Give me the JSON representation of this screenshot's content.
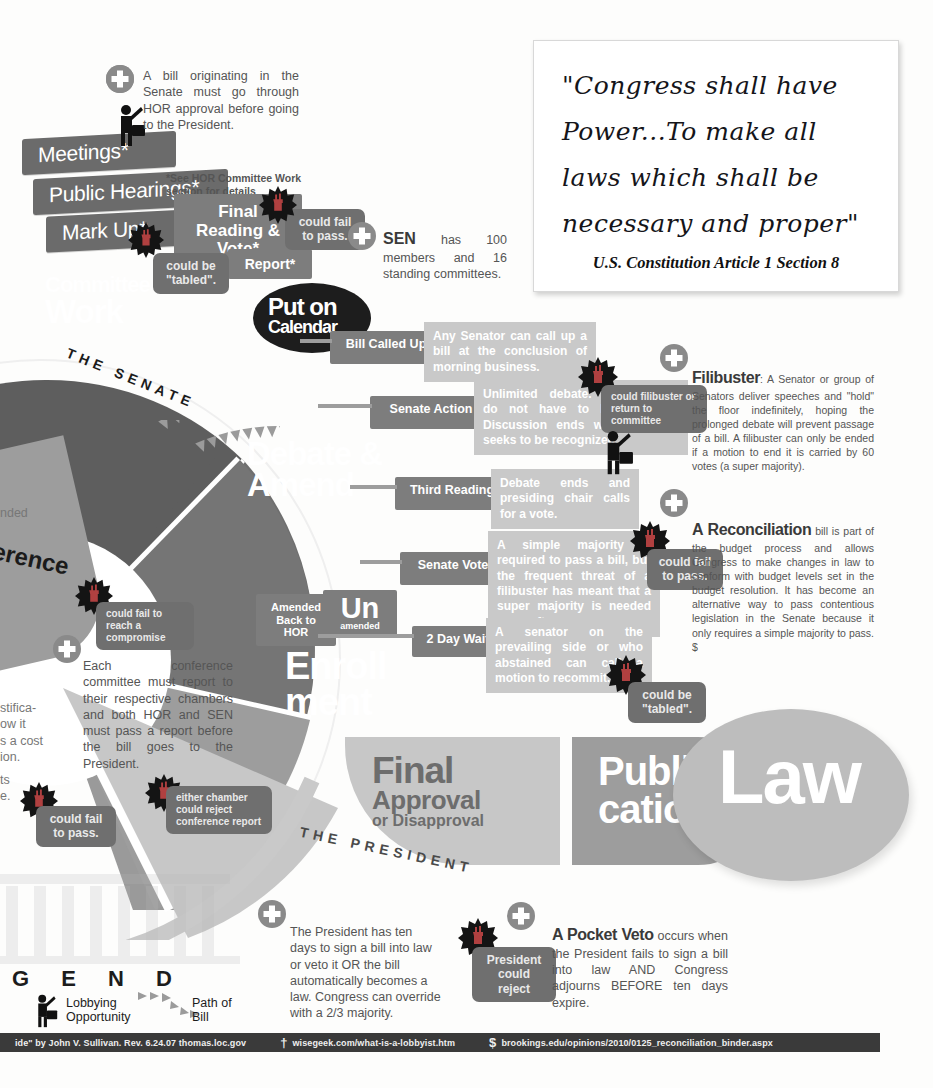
{
  "quote": {
    "lines": [
      "\"Congress shall have",
      "Power...To make all",
      "laws which shall be",
      "necessary and proper\""
    ],
    "source": "U.S. Constitution Article 1 Section 8"
  },
  "notes": {
    "senate_origin": "A bill originating in the Senate must go through HOR approval before going to the President.",
    "hor_footnote": "*See HOR Committee Work section for details",
    "sen_title": "SEN",
    "sen_body": "has 100 members and 16 standing committees.",
    "filibuster_title": "Filibuster",
    "filibuster_body": ": A Senator or group of Senators deliver speeches and \"hold\" the floor indefinitely, hoping the prolonged debate will prevent passage of a bill. A filibuster can only be ended if a motion to end it is carried by 60 votes (a super majority).",
    "reconciliation_title": "A Reconciliation",
    "reconciliation_body": "bill is part of the budget process and allows Congress to make changes in law to conform with budget levels set in the budget resolution. It has become an alternative way to pass contentious legislation in the Senate because it only requires a simple majority to pass. $",
    "conference_body": "Each conference committee must report to their respective chambers and both HOR and SEN must pass a report before the bill goes to the President.",
    "president_body": "The President has ten days to sign a bill into law or veto it OR the bill automatically becomes a law.  Congress can override with a 2/3 majority.",
    "pocketveto_title": "A Pocket Veto",
    "pocketveto_body": "occurs when the President fails to sign a bill into law AND Congress adjourns BEFORE ten days expire."
  },
  "steps": {
    "meetings": "Meetings*",
    "public_hearings": "Public Hearings*",
    "mark_up": "Mark Up*",
    "final_reading": "Final Reading & Vote*",
    "report": "Report*"
  },
  "warnings": {
    "could_be_tabled_1": "could be \"tabled\".",
    "could_fail_to_pass_1": "could fail to pass.",
    "could_filibuster": "could filibuster or return to committee",
    "could_fail_to_pass_2": "could fail to pass.",
    "could_be_tabled_2": "could be \"tabled\".",
    "could_fail_compromise": "could fail to reach a compromise",
    "could_fail_to_pass_3": "could fail to pass.",
    "either_chamber_reject": "either chamber could reject conference report",
    "president_could_reject": "President could reject"
  },
  "wheel": {
    "committee_work_l1": "Committee",
    "committee_work_l2": "Work",
    "put_on_calendar_l1": "Put on",
    "put_on_calendar_l2": "Calendar",
    "debate_amend_l1": "Debate &",
    "debate_amend_l2": "Amend",
    "enrollment_l1": "Enroll",
    "enrollment_l2": "ment",
    "final_approval_l1": "Final",
    "final_approval_l2": "Approval",
    "final_approval_l3": "or Disapproval",
    "publication_l1": "Publi",
    "publication_l2": "cation",
    "law": "Law",
    "conference_partial": "erence",
    "arc_senate": "THE SENATE",
    "arc_president": "THE PRESIDENT"
  },
  "flow": [
    {
      "label": "Bill Called Up",
      "desc": "Any  Senator can call up a  bill at the conclusion of morning business."
    },
    {
      "label": "Senate Action",
      "desc": "Unlimited debate. Amendments do not have to be germane. Discussion ends when no one seeks to be recognized."
    },
    {
      "label": "Third Reading",
      "desc": "Debate ends and presiding chair calls for a vote."
    },
    {
      "label": "Senate Vote",
      "desc": "A simple majority is required to pass a bill, but the frequent threat of a filibuster has meant that a super majority is needed more often."
    },
    {
      "label": "2 Day Wait",
      "desc": "A senator on the prevailing side or who abstained can call a motion to recommit."
    }
  ],
  "amend_boxes": {
    "amended_l1": "Amended",
    "amended_l2": "Back to HOR",
    "un_l1": "Un",
    "un_l2": "amended"
  },
  "legend": {
    "title_partial": "G E N D",
    "lobbying_l1": "Lobbying",
    "lobbying_l2": "Opportunity",
    "path_l1": "Path of",
    "path_l2": "Bill"
  },
  "left_edge_fragments": {
    "f1": "nded",
    "f2": "stifica-",
    "f3": "ow it",
    "f4": "s a cost",
    "f5": "ion.",
    "f6": "ts",
    "f7": "e."
  },
  "sources": [
    {
      "symbol": "",
      "text": "ide\" by John V. Sullivan.  Rev. 6.24.07 thomas.loc.gov"
    },
    {
      "symbol": "†",
      "text": "wisegeek.com/what-is-a-lobbyist.htm"
    },
    {
      "symbol": "$",
      "text": "brookings.edu/opinions/2010/0125_reconciliation_binder.aspx"
    }
  ],
  "colors": {
    "dark": "#6b6b6b",
    "mid": "#8a8a8a",
    "light": "#c9c9c9",
    "wheel_dark": "#5e5e5e",
    "wheel_mid": "#8f8f8f",
    "wheel_light": "#c2c2c2",
    "law": "#bdbdbd",
    "footer": "#3a3a3a"
  }
}
